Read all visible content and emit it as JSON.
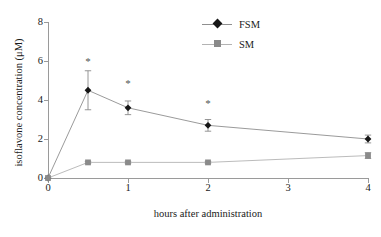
{
  "chart_data": {
    "type": "line",
    "title": "",
    "xlabel": "hours after administration",
    "ylabel": "isoflavone concentration (μM)",
    "xlim": [
      0,
      4
    ],
    "ylim": [
      0,
      8
    ],
    "xticks": [
      "0",
      "1",
      "2",
      "3",
      "4"
    ],
    "yticks": [
      "0",
      "2",
      "4",
      "6",
      "8"
    ],
    "grid": false,
    "legend_position": "top-right-inside",
    "x": [
      0,
      0.5,
      1,
      2,
      4
    ],
    "series": [
      {
        "name": "FSM",
        "marker": "diamond",
        "color": "#161616",
        "line_color": "#8f8f8f",
        "values": [
          0,
          4.5,
          3.6,
          2.7,
          2.0
        ],
        "errors": [
          0,
          1.0,
          0.35,
          0.3,
          0.2
        ]
      },
      {
        "name": "SM",
        "marker": "square",
        "color": "#8a8a8a",
        "line_color": "#b3b3b3",
        "values": [
          0,
          0.8,
          0.8,
          0.8,
          1.15
        ],
        "errors": [
          0,
          0.05,
          0.05,
          0.05,
          0.15
        ]
      }
    ],
    "annotations": [
      {
        "text": "*",
        "x": 0.5,
        "y": 6.0
      },
      {
        "text": "*",
        "x": 1.0,
        "y": 4.85
      },
      {
        "text": "*",
        "x": 2.0,
        "y": 3.85
      }
    ]
  },
  "legend": {
    "items": [
      {
        "label": "FSM"
      },
      {
        "label": "SM"
      }
    ]
  }
}
